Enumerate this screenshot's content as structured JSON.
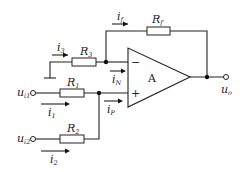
{
  "diagram": {
    "type": "op-amp summing circuit",
    "opamp": {
      "label": "A",
      "inverting": "−",
      "noninverting": "+"
    },
    "resistors": {
      "rf": {
        "main": "R",
        "sub": "f"
      },
      "r3": {
        "main": "R",
        "sub": "3"
      },
      "r1": {
        "main": "R",
        "sub": "1"
      },
      "r2": {
        "main": "R",
        "sub": "2"
      }
    },
    "currents": {
      "if": {
        "main": "i",
        "sub": "f"
      },
      "i3": {
        "main": "i",
        "sub": "3"
      },
      "iN": {
        "main": "i",
        "sub": "N"
      },
      "iP": {
        "main": "i",
        "sub": "P"
      },
      "i1": {
        "main": "i",
        "sub": "1"
      },
      "i2": {
        "main": "i",
        "sub": "2"
      }
    },
    "voltages": {
      "ui1": {
        "main": "u",
        "sub": "i1"
      },
      "ui2": {
        "main": "u",
        "sub": "i2"
      },
      "uo": {
        "main": "u",
        "sub": "o"
      }
    }
  }
}
